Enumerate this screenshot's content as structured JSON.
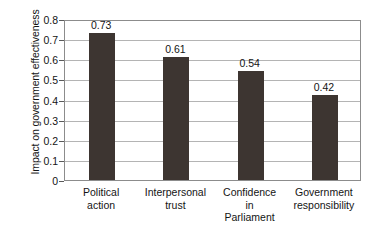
{
  "chart_data": {
    "type": "bar",
    "title": "",
    "xlabel": "",
    "ylabel": "Impact on government effectiveness",
    "categories": [
      "Political action",
      "Interpersonal trust",
      "Confidence in Parliament",
      "Government responsibility"
    ],
    "category_lines": [
      [
        "Political",
        "action"
      ],
      [
        "Interpersonal",
        "trust"
      ],
      [
        "Confidence",
        "in",
        "Parliament"
      ],
      [
        "Government",
        "responsibility"
      ]
    ],
    "values": [
      0.73,
      0.61,
      0.54,
      0.42
    ],
    "value_labels": [
      "0.73",
      "0.61",
      "0.54",
      "0.42"
    ],
    "ylim": [
      0,
      0.8
    ],
    "ytick_values": [
      0.8,
      0.7,
      0.6,
      0.5,
      0.4,
      0.3,
      0.2,
      0.1,
      0
    ],
    "ytick_labels": [
      "0.8",
      "0.7",
      "0.6",
      "0.5",
      "0.4",
      "0.3",
      "0.2",
      "0.1",
      "0"
    ],
    "grid": true,
    "grid_axis": "y",
    "legend": false,
    "legend_position": "none",
    "bar_color": "#3d3531",
    "grid_color": "#b4b4b4",
    "axis_color": "#8c8c8c",
    "background_color": "#ffffff",
    "text_color": "#141414"
  }
}
